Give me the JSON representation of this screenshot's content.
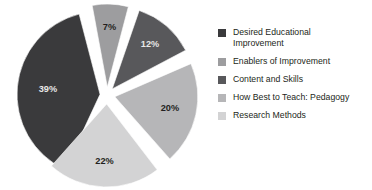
{
  "chart_data": {
    "type": "pie",
    "title": "",
    "subtitle": "",
    "xlabel": "",
    "ylabel": "",
    "exploded": true,
    "legend_position": "right",
    "grid": false,
    "categories": [
      "Desired Educational Improvement",
      "Enablers of Improvement",
      "Content and Skills",
      "How Best to Teach: Pedagogy",
      "Research Methods"
    ],
    "values": [
      39,
      7,
      12,
      20,
      22
    ],
    "data_labels": [
      "39%",
      "7%",
      "12%",
      "20%",
      "22%"
    ],
    "colors": [
      "#3a3a3c",
      "#9d9d9f",
      "#58585b",
      "#b6b6b8",
      "#d3d3d4"
    ],
    "slices": [
      {
        "label": "Desired Educational Improvement",
        "legend_label": "Desired Educational\nImprovement",
        "value": 39,
        "data_label": "39%",
        "color": "#3a3a3c",
        "label_color": "#e8e8e8",
        "start_angle": 205,
        "end_angle": 345.4,
        "explode": 7,
        "label_radius": 0.63
      },
      {
        "label": "Enablers of Improvement",
        "legend_label": "Enablers of Improvement",
        "value": 7,
        "data_label": "7%",
        "color": "#9d9d9f",
        "label_color": "#231f20",
        "start_angle": 349.5,
        "end_angle": 14.7,
        "explode": 8,
        "label_radius": 0.72
      },
      {
        "label": "Content and Skills",
        "legend_label": "Content and Skills",
        "value": 12,
        "data_label": "12%",
        "color": "#58585b",
        "label_color": "#e8e8e8",
        "start_angle": 19,
        "end_angle": 62.2,
        "explode": 8,
        "label_radius": 0.7
      },
      {
        "label": "How Best to Teach: Pedagogy",
        "legend_label": "How Best to Teach: Pedagogy",
        "value": 20,
        "data_label": "20%",
        "color": "#b6b6b8",
        "label_color": "#231f20",
        "start_angle": 66.5,
        "end_angle": 138.5,
        "explode": 8,
        "label_radius": 0.68
      },
      {
        "label": "Research Methods",
        "legend_label": "Research Methods",
        "value": 22,
        "data_label": "22%",
        "color": "#d3d3d4",
        "label_color": "#231f20",
        "start_angle": 142.5,
        "end_angle": 221.7,
        "explode": 9,
        "label_radius": 0.7
      }
    ],
    "legend": [
      {
        "label": "Desired Educational\nImprovement",
        "color": "#3a3a3c"
      },
      {
        "label": "Enablers of Improvement",
        "color": "#9d9d9f"
      },
      {
        "label": "Content and Skills",
        "color": "#58585b"
      },
      {
        "label": "How Best to Teach: Pedagogy",
        "color": "#b6b6b8"
      },
      {
        "label": "Research Methods",
        "color": "#d3d3d4"
      }
    ]
  },
  "geometry": {
    "cx": 107,
    "cy": 95,
    "radius": 83
  }
}
